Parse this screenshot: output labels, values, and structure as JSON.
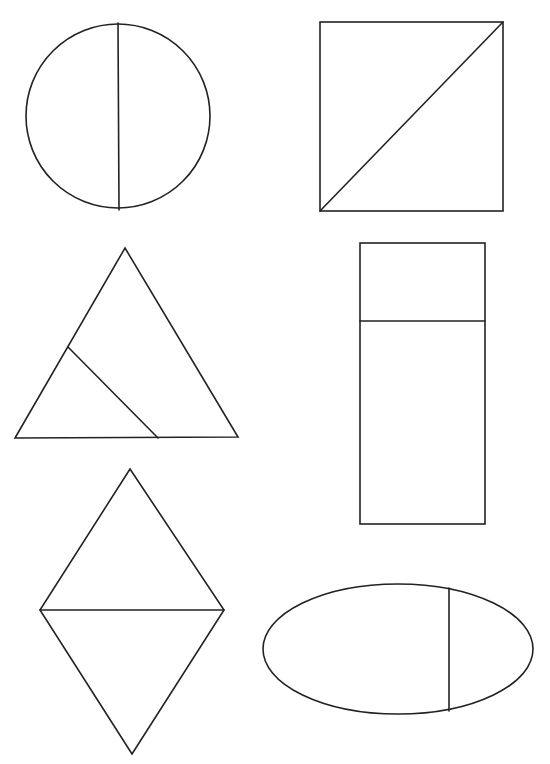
{
  "page": {
    "background_color": "#ffffff",
    "stroke_color": "#222222"
  },
  "shapes": [
    {
      "id": "circle",
      "kind": "circle",
      "division": "vertical diameter",
      "parts": 2,
      "equal_parts": true
    },
    {
      "id": "square",
      "kind": "square",
      "division": "diagonal (bottom-left to top-right)",
      "parts": 2,
      "equal_parts": true
    },
    {
      "id": "triangle",
      "kind": "triangle",
      "division": "line from left side to base",
      "parts": 2,
      "equal_parts": false
    },
    {
      "id": "rectangle",
      "kind": "rectangle",
      "division": "horizontal line near top",
      "parts": 2,
      "equal_parts": false
    },
    {
      "id": "rhombus",
      "kind": "rhombus",
      "division": "horizontal diagonal",
      "parts": 2,
      "equal_parts": true
    },
    {
      "id": "ellipse",
      "kind": "ellipse",
      "division": "vertical chord right of center",
      "parts": 2,
      "equal_parts": false
    }
  ]
}
